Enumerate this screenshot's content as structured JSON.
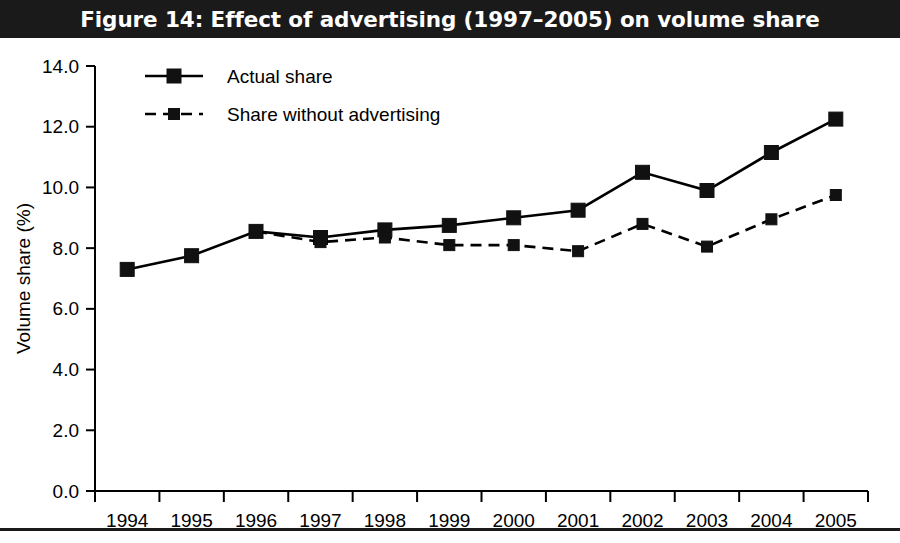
{
  "figure": {
    "title": "Figure 14: Effect of advertising (1997–2005) on volume share"
  },
  "colors": {
    "title_bar_bg": "#1a1a1a",
    "title_text": "#ffffff",
    "plot_bg": "#ffffff",
    "ink": "#000000",
    "marker": "#111111"
  },
  "chart_data": {
    "type": "line",
    "title": "Figure 14: Effect of advertising (1997–2005) on volume share",
    "xlabel": "",
    "ylabel": "Volume share (%)",
    "categories": [
      "1994",
      "1995",
      "1996",
      "1997",
      "1998",
      "1999",
      "2000",
      "2001",
      "2002",
      "2003",
      "2004",
      "2005"
    ],
    "ylim": [
      0.0,
      14.0
    ],
    "ytick_step": 2.0,
    "yticks": [
      "0.0",
      "2.0",
      "4.0",
      "6.0",
      "8.0",
      "10.0",
      "12.0",
      "14.0"
    ],
    "grid": false,
    "legend_position": "top-left inside",
    "series": [
      {
        "name": "Actual share",
        "style": "solid",
        "marker": "square",
        "values": [
          7.3,
          7.75,
          8.55,
          8.35,
          8.6,
          8.75,
          9.0,
          9.25,
          10.5,
          9.9,
          11.15,
          12.25
        ]
      },
      {
        "name": "Share without advertising",
        "style": "dashed",
        "marker": "square",
        "values": [
          null,
          null,
          8.55,
          8.2,
          8.35,
          8.1,
          8.1,
          7.9,
          8.8,
          8.05,
          8.95,
          9.75
        ]
      }
    ]
  }
}
